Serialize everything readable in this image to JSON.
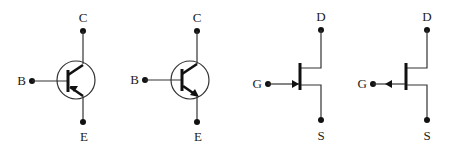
{
  "diagram": {
    "title": "",
    "symbols": [
      {
        "id": "pnp-bjt",
        "type": "PNP bipolar transistor",
        "labels": {
          "collector": "C",
          "base": "B",
          "emitter": "E"
        }
      },
      {
        "id": "npn-bjt",
        "type": "NPN bipolar transistor",
        "labels": {
          "collector": "C",
          "base": "B",
          "emitter": "E"
        }
      },
      {
        "id": "n-channel-jfet",
        "type": "N-channel JFET",
        "labels": {
          "drain": "D",
          "gate": "G",
          "source": "S"
        }
      },
      {
        "id": "p-channel-jfet",
        "type": "P-channel JFET",
        "labels": {
          "drain": "D",
          "gate": "G",
          "source": "S"
        }
      }
    ],
    "colors": {
      "line": "#333333",
      "fill": "#111111",
      "background": "#ffffff"
    }
  }
}
